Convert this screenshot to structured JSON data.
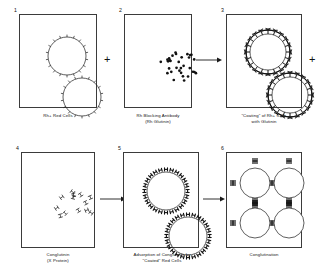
{
  "figure": {
    "ink_color": "#1a1a1a",
    "panel_border_color": "#3b3b3b",
    "background": "#ffffff"
  },
  "panels": [
    {
      "number": "1",
      "caption": "Rh+ Red Cells",
      "content_type": "red-cells-plain",
      "cells": [
        {
          "cx": 47,
          "cy": 41,
          "r": 19,
          "spikes": 18,
          "spike_style": "tick"
        },
        {
          "cx": 62,
          "cy": 82,
          "r": 19,
          "spikes": 18,
          "spike_style": "tick"
        }
      ]
    },
    {
      "number": "2",
      "caption": "Rh Blocking Antibody\n(Rh Glutinin)",
      "content_type": "antibody-dots",
      "dot_count": 32,
      "dot_cluster": {
        "cx": 54,
        "cy": 51,
        "rx": 19,
        "ry": 16
      }
    },
    {
      "number": "3",
      "caption": "\"Coating\" of Rh+ Cells\nwith Glutinin",
      "content_type": "coated-cells",
      "cells": [
        {
          "cx": 41,
          "cy": 37,
          "r": 18,
          "spikes": 20,
          "spike_style": "y-antibody"
        },
        {
          "cx": 63,
          "cy": 80,
          "r": 18,
          "spikes": 20,
          "spike_style": "y-antibody"
        }
      ]
    },
    {
      "number": "4",
      "caption": "Conglutinin\n(X Protein)",
      "content_type": "conglutinin-molecules",
      "molecule_count": 13,
      "molecule_cluster": {
        "cx": 52,
        "cy": 54,
        "rx": 20,
        "ry": 17
      }
    },
    {
      "number": "5",
      "caption": "Adsorption of Conglutinin by\n\"Coated\" Red Cells",
      "content_type": "conglutinin-coated-cells",
      "cells": [
        {
          "cx": 42,
          "cy": 38,
          "r": 19,
          "spikes": 24,
          "spike_style": "h-conglutinin"
        },
        {
          "cx": 64,
          "cy": 83,
          "r": 19,
          "spikes": 24,
          "spike_style": "h-conglutinin"
        }
      ]
    },
    {
      "number": "6",
      "caption": "Conglutination",
      "content_type": "lattice",
      "lattice_cells": [
        {
          "cx": 28,
          "cy": 30,
          "r": 15
        },
        {
          "cx": 62,
          "cy": 30,
          "r": 15
        },
        {
          "cx": 28,
          "cy": 70,
          "r": 15
        },
        {
          "cx": 62,
          "cy": 70,
          "r": 15
        }
      ],
      "bridge_count": 22
    }
  ],
  "connectors": [
    {
      "kind": "plus",
      "symbol": "+",
      "after_panel": "1",
      "row": "top"
    },
    {
      "kind": "arrow",
      "symbol": "→",
      "after_panel": "2",
      "row": "top"
    },
    {
      "kind": "plus",
      "symbol": "+",
      "after_panel": "3",
      "row": "top"
    },
    {
      "kind": "arrow",
      "symbol": "→",
      "after_panel": "4",
      "row": "bottom"
    },
    {
      "kind": "arrow",
      "symbol": "→",
      "after_panel": "5",
      "row": "bottom"
    }
  ]
}
